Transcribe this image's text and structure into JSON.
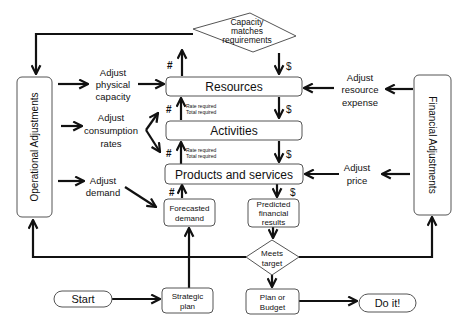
{
  "diagram": {
    "type": "flowchart",
    "nodes": {
      "capacity_check": {
        "label_lines": [
          "Capacity",
          "matches",
          "requirements"
        ],
        "shape": "diamond"
      },
      "resources": {
        "label": "Resources",
        "shape": "rounded-rect"
      },
      "activities": {
        "label": "Activities",
        "shape": "rounded-rect"
      },
      "products_services": {
        "label": "Products and services",
        "shape": "rounded-rect"
      },
      "forecasted_demand": {
        "label_lines": [
          "Forecasted",
          "demand"
        ],
        "shape": "rounded-rect"
      },
      "predicted_results": {
        "label_lines": [
          "Predicted",
          "financial",
          "results"
        ],
        "shape": "rounded-rect"
      },
      "meets_target": {
        "label_lines": [
          "Meets",
          "target"
        ],
        "shape": "diamond"
      },
      "strategic_plan": {
        "label_lines": [
          "Strategic",
          "plan"
        ],
        "shape": "rounded-rect"
      },
      "plan_budget": {
        "label_lines": [
          "Plan or",
          "Budget"
        ],
        "shape": "rounded-rect"
      },
      "start": {
        "label": "Start",
        "shape": "pill"
      },
      "do_it": {
        "label": "Do it!",
        "shape": "pill"
      },
      "operational_adjustments": {
        "label": "Operational Adjustments",
        "shape": "vertical-rounded-rect"
      },
      "financial_adjustments": {
        "label": "Financial Adjustments",
        "shape": "vertical-rounded-rect"
      }
    },
    "annotations": {
      "adjust_physical_capacity": [
        "Adjust",
        "physical",
        "capacity"
      ],
      "adjust_consumption_rates": [
        "Adjust",
        "consumption",
        "rates"
      ],
      "adjust_demand": [
        "Adjust",
        "demand"
      ],
      "adjust_resource_expense": [
        "Adjust",
        "resource",
        "expense"
      ],
      "adjust_price": [
        "Adjust",
        "price"
      ],
      "rate_required": "Rate required",
      "total_required": "Total required",
      "quantity_symbol": "#",
      "money_symbol": "$"
    },
    "edges": [
      {
        "from": "start",
        "to": "strategic_plan"
      },
      {
        "from": "strategic_plan",
        "to": "forecasted_demand"
      },
      {
        "from": "forecasted_demand",
        "to": "products_services",
        "label": "#"
      },
      {
        "from": "products_services",
        "to": "activities",
        "label": "#",
        "note": [
          "Rate required",
          "Total required"
        ]
      },
      {
        "from": "activities",
        "to": "resources",
        "label": "#",
        "note": [
          "Rate required",
          "Total required"
        ]
      },
      {
        "from": "resources",
        "to": "capacity_check",
        "label": "#"
      },
      {
        "from": "capacity_check",
        "to": "operational_adjustments"
      },
      {
        "from": "capacity_check",
        "to": "resources",
        "label": "$"
      },
      {
        "from": "resources",
        "to": "activities",
        "label": "$"
      },
      {
        "from": "activities",
        "to": "products_services",
        "label": "$"
      },
      {
        "from": "products_services",
        "to": "predicted_results",
        "label": "$"
      },
      {
        "from": "predicted_results",
        "to": "meets_target"
      },
      {
        "from": "meets_target",
        "to": "operational_adjustments"
      },
      {
        "from": "meets_target",
        "to": "financial_adjustments"
      },
      {
        "from": "meets_target",
        "to": "plan_budget"
      },
      {
        "from": "plan_budget",
        "to": "do_it"
      },
      {
        "from": "operational_adjustments",
        "to": "adjust_physical_capacity"
      },
      {
        "from": "adjust_physical_capacity",
        "to": "resources"
      },
      {
        "from": "operational_adjustments",
        "to": "adjust_consumption_rates"
      },
      {
        "from": "adjust_consumption_rates",
        "to": "activities"
      },
      {
        "from": "adjust_consumption_rates",
        "to": "products_services"
      },
      {
        "from": "operational_adjustments",
        "to": "adjust_demand"
      },
      {
        "from": "adjust_demand",
        "to": "forecasted_demand"
      },
      {
        "from": "financial_adjustments",
        "to": "adjust_resource_expense"
      },
      {
        "from": "adjust_resource_expense",
        "to": "resources"
      },
      {
        "from": "financial_adjustments",
        "to": "adjust_price"
      },
      {
        "from": "adjust_price",
        "to": "products_services"
      }
    ]
  }
}
